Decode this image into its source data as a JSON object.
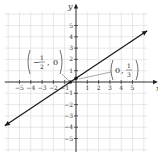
{
  "chart_data": {
    "type": "line",
    "title": "",
    "xlabel": "x",
    "ylabel": "y",
    "xlim": [
      -6,
      6.5
    ],
    "ylim": [
      -6,
      6
    ],
    "grid": true,
    "x_ticks": [
      -5,
      -4,
      -3,
      -2,
      -1,
      1,
      2,
      3,
      4,
      5
    ],
    "y_ticks": [
      -5,
      -4,
      -3,
      -2,
      -1,
      1,
      2,
      3,
      4,
      5
    ],
    "x_tick_labels": [
      "−5",
      "−4",
      "−3",
      "−2",
      "−1",
      "1",
      "2",
      "3",
      "4",
      "5"
    ],
    "y_tick_labels": [
      "−5",
      "−4",
      "−3",
      "−2",
      "−1",
      "1",
      "2",
      "3",
      "4",
      "5"
    ],
    "series": [
      {
        "name": "line",
        "equation": "y = (2/3)x + 1/3",
        "x": [
          -6.3,
          6.3
        ],
        "y": [
          -3.87,
          4.53
        ],
        "arrows": "both"
      }
    ],
    "points": [
      {
        "x": -0.5,
        "y": 0,
        "label": "(−1/2, 0)"
      },
      {
        "x": 0,
        "y": 0.3333,
        "label": "(0, 1/3)"
      }
    ],
    "annotations": [
      {
        "text": "(−½, 0)",
        "num": "1",
        "den": "2",
        "sign": "−",
        "other": "0",
        "position": "upper-left"
      },
      {
        "text": "(0, ⅓)",
        "num": "1",
        "den": "3",
        "other": "0",
        "position": "right"
      }
    ]
  },
  "colors": {
    "grid": "#d8d8d8",
    "axis": "#222222",
    "line": "#1a1a1a",
    "text": "#333333"
  }
}
